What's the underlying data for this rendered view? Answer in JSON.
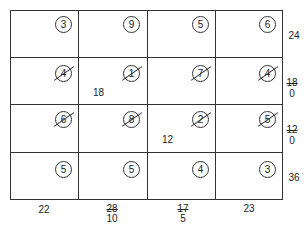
{
  "grid": {
    "rows": 4,
    "cols": 4,
    "costs": [
      [
        {
          "value": "3",
          "crossed": false
        },
        {
          "value": "9",
          "crossed": false
        },
        {
          "value": "5",
          "crossed": false
        },
        {
          "value": "6",
          "crossed": false
        }
      ],
      [
        {
          "value": "4",
          "crossed": true
        },
        {
          "value": "1",
          "crossed": true
        },
        {
          "value": "7",
          "crossed": true
        },
        {
          "value": "4",
          "crossed": true
        }
      ],
      [
        {
          "value": "6",
          "crossed": true
        },
        {
          "value": "8",
          "crossed": true
        },
        {
          "value": "2",
          "crossed": true
        },
        {
          "value": "5",
          "crossed": true
        }
      ],
      [
        {
          "value": "5",
          "crossed": false
        },
        {
          "value": "5",
          "crossed": false
        },
        {
          "value": "4",
          "crossed": false
        },
        {
          "value": "3",
          "crossed": false
        }
      ]
    ],
    "allocations": [
      {
        "row": 1,
        "col": 1,
        "value": "18"
      },
      {
        "row": 2,
        "col": 2,
        "value": "12"
      }
    ]
  },
  "supply": [
    {
      "old": "",
      "current": "24"
    },
    {
      "old": "18",
      "current": "0"
    },
    {
      "old": "12",
      "current": "0"
    },
    {
      "old": "",
      "current": "36"
    }
  ],
  "demand": [
    {
      "old": "",
      "current": "22"
    },
    {
      "old": "28",
      "current": "10"
    },
    {
      "old": "17",
      "current": "5"
    },
    {
      "old": "",
      "current": "23"
    }
  ]
}
